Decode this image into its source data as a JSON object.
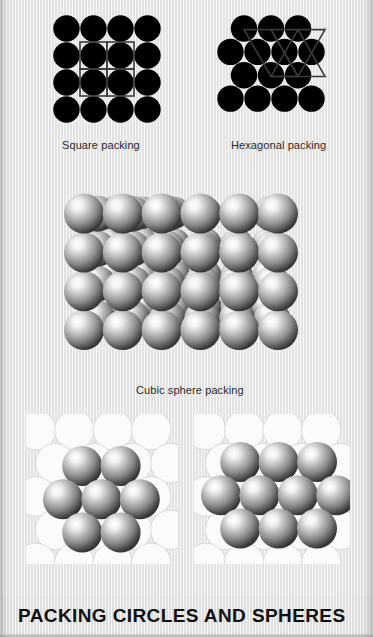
{
  "page": {
    "title": "PACKING CIRCLES AND SPHERES",
    "background_color": "#ededed",
    "title_color": "#111111"
  },
  "figures": [
    {
      "id": "square-packing",
      "caption": "Square packing",
      "type": "circle-packing-2d",
      "lattice": "square",
      "circle_color": "#000000",
      "lattice_line_color": "#3d3d3d",
      "rows": 4,
      "cols": 4,
      "circle_diameter": 27
    },
    {
      "id": "hexagonal-packing",
      "caption": "Hexagonal packing",
      "type": "circle-packing-2d",
      "lattice": "hexagonal",
      "circle_color": "#000000",
      "lattice_line_color": "#3d3d3d",
      "row_counts": [
        3,
        4,
        3,
        4
      ],
      "circle_diameter": 27
    },
    {
      "id": "cubic-sphere-packing",
      "caption": "Cubic sphere packing",
      "type": "sphere-packing-3d",
      "lattice": "cubic",
      "sphere_highlight_color": "#ffffff",
      "sphere_mid_color": "#9a9a9a",
      "sphere_edge_color": "#3a3a3a",
      "rows": 4,
      "cols": 6,
      "depth_layers": 3
    },
    {
      "id": "hexagonal-layer-packing-small",
      "caption": "",
      "type": "sphere-layer-on-base",
      "base_color": "#fbfbfb",
      "base_edge_color": "#d6d6d6",
      "top_sphere_count": 7,
      "top_row_counts": [
        2,
        3,
        2
      ],
      "sphere_highlight_color": "#ffffff",
      "sphere_edge_color": "#3a3a3a"
    },
    {
      "id": "hexagonal-layer-packing-large",
      "caption": "",
      "type": "sphere-layer-on-base",
      "base_color": "#fbfbfb",
      "base_edge_color": "#d6d6d6",
      "top_sphere_count": 10,
      "top_row_counts": [
        3,
        4,
        3
      ],
      "sphere_highlight_color": "#ffffff",
      "sphere_edge_color": "#3a3a3a"
    }
  ],
  "captions": {
    "square": "Square packing",
    "hexagonal": "Hexagonal packing",
    "cubic": "Cubic sphere packing"
  }
}
